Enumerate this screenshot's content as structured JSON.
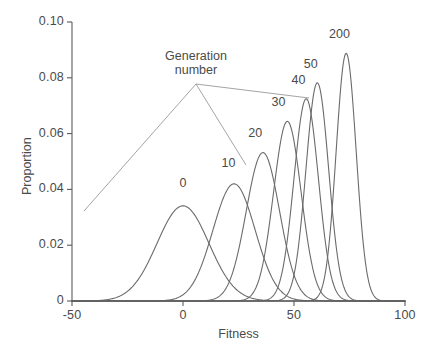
{
  "chart_data": {
    "type": "line",
    "title": "",
    "xlabel": "Fitness",
    "ylabel": "Proportion",
    "xlim": [
      -50,
      100
    ],
    "ylim": [
      0,
      0.1
    ],
    "xticks": [
      -50,
      0,
      50,
      100
    ],
    "xtick_labels": [
      "-50",
      "0",
      "50",
      "100"
    ],
    "yticks": [
      0,
      0.02,
      0.04,
      0.06,
      0.08,
      0.1
    ],
    "ytick_labels": [
      "0",
      "0.02",
      "0.04",
      "0.06",
      "0.08",
      "0.10"
    ],
    "grid": false,
    "legend": "none",
    "annotation": {
      "text_line1": "Generation",
      "text_line2": "number",
      "points_to": [
        "0",
        "10",
        "40"
      ]
    },
    "series": [
      {
        "name": "0",
        "label": "0",
        "mean": 0.0,
        "sd": 11.7,
        "peak_value": 0.0341,
        "peak_x": 0.0
      },
      {
        "name": "10",
        "label": "10",
        "mean": 23.0,
        "sd": 9.5,
        "peak_value": 0.042,
        "peak_x": 23.0
      },
      {
        "name": "20",
        "label": "20",
        "mean": 36.0,
        "sd": 7.5,
        "peak_value": 0.0532,
        "peak_x": 36.0
      },
      {
        "name": "30",
        "label": "30",
        "mean": 47.0,
        "sd": 6.2,
        "peak_value": 0.0644,
        "peak_x": 47.0
      },
      {
        "name": "40",
        "label": "40",
        "mean": 55.5,
        "sd": 5.5,
        "peak_value": 0.0725,
        "peak_x": 55.5
      },
      {
        "name": "50",
        "label": "50",
        "mean": 60.5,
        "sd": 5.1,
        "peak_value": 0.0782,
        "peak_x": 60.5
      },
      {
        "name": "200",
        "label": "200",
        "mean": 73.5,
        "sd": 4.5,
        "peak_value": 0.0888,
        "peak_x": 73.5
      }
    ],
    "curve_label_positions": [
      {
        "name": "0",
        "x": 0.0,
        "y": 0.0418
      },
      {
        "name": "10",
        "x": 20.5,
        "y": 0.0492
      },
      {
        "name": "20",
        "x": 32.5,
        "y": 0.06
      },
      {
        "name": "30",
        "x": 43.0,
        "y": 0.071
      },
      {
        "name": "40",
        "x": 52.0,
        "y": 0.079
      },
      {
        "name": "50",
        "x": 57.5,
        "y": 0.0845
      },
      {
        "name": "200",
        "x": 70.5,
        "y": 0.0955
      }
    ],
    "colors": {
      "curve": "#6b6b6b",
      "axis": "#5a5a5a",
      "text": "#4a4a4a",
      "leader": "#9a9a9a",
      "background": "#ffffff"
    }
  }
}
